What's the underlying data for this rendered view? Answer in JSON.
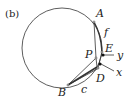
{
  "panel_label": "(b)",
  "points": {
    "A": "A",
    "B": "B",
    "P": "P",
    "E": "E",
    "D": "D"
  },
  "arcs": {
    "f": "f",
    "c": "c"
  },
  "arrows": {
    "y": "y",
    "x": "x"
  },
  "colors": {
    "stroke": "#333333",
    "background": "#ffffff"
  }
}
